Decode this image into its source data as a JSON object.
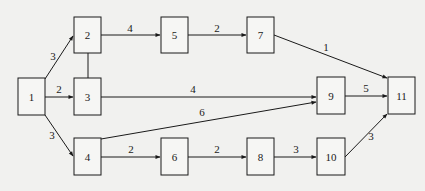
{
  "nodes": [
    {
      "id": "1",
      "label": "1",
      "x": 18,
      "y": 78,
      "w": 27,
      "h": 37
    },
    {
      "id": "2",
      "label": "2",
      "x": 74,
      "y": 17,
      "w": 27,
      "h": 36
    },
    {
      "id": "3",
      "label": "3",
      "x": 74,
      "y": 78,
      "w": 27,
      "h": 37
    },
    {
      "id": "4",
      "label": "4",
      "x": 74,
      "y": 138,
      "w": 27,
      "h": 37
    },
    {
      "id": "5",
      "label": "5",
      "x": 161,
      "y": 17,
      "w": 27,
      "h": 36
    },
    {
      "id": "6",
      "label": "6",
      "x": 161,
      "y": 138,
      "w": 27,
      "h": 37
    },
    {
      "id": "7",
      "label": "7",
      "x": 247,
      "y": 17,
      "w": 27,
      "h": 36
    },
    {
      "id": "8",
      "label": "8",
      "x": 247,
      "y": 138,
      "w": 27,
      "h": 37
    },
    {
      "id": "9",
      "label": "9",
      "x": 317,
      "y": 77,
      "w": 28,
      "h": 37
    },
    {
      "id": "10",
      "label": "10",
      "x": 317,
      "y": 138,
      "w": 28,
      "h": 37
    },
    {
      "id": "11",
      "label": "11",
      "x": 388,
      "y": 77,
      "w": 27,
      "h": 37
    }
  ],
  "edges": [
    {
      "from": "1",
      "to": "2",
      "weight": "3",
      "x1": 45,
      "y1": 79,
      "x2": 73,
      "y2": 36,
      "lx": 53,
      "ly": 60
    },
    {
      "from": "1",
      "to": "3",
      "weight": "2",
      "x1": 45,
      "y1": 97,
      "x2": 73,
      "y2": 97,
      "lx": 59,
      "ly": 93
    },
    {
      "from": "1",
      "to": "4",
      "weight": "3",
      "x1": 45,
      "y1": 115,
      "x2": 73,
      "y2": 156,
      "lx": 52,
      "ly": 139
    },
    {
      "from": "2",
      "to": "5",
      "weight": "4",
      "x1": 101,
      "y1": 35,
      "x2": 160,
      "y2": 35,
      "lx": 130,
      "ly": 32
    },
    {
      "from": "5",
      "to": "7",
      "weight": "2",
      "x1": 188,
      "y1": 35,
      "x2": 246,
      "y2": 35,
      "lx": 217,
      "ly": 32
    },
    {
      "from": "7",
      "to": "11",
      "weight": "1",
      "x1": 274,
      "y1": 35,
      "x2": 387,
      "y2": 78,
      "lx": 326,
      "ly": 51
    },
    {
      "from": "3",
      "to": "9",
      "weight": "4",
      "x1": 101,
      "y1": 97,
      "x2": 316,
      "y2": 97,
      "lx": 193,
      "ly": 93
    },
    {
      "from": "4",
      "to": "9",
      "weight": "6",
      "x1": 101,
      "y1": 139,
      "x2": 316,
      "y2": 102,
      "lx": 202,
      "ly": 116
    },
    {
      "from": "9",
      "to": "11",
      "weight": "5",
      "x1": 345,
      "y1": 96,
      "x2": 387,
      "y2": 96,
      "lx": 366,
      "ly": 92
    },
    {
      "from": "4",
      "to": "6",
      "weight": "2",
      "x1": 101,
      "y1": 157,
      "x2": 160,
      "y2": 157,
      "lx": 131,
      "ly": 153
    },
    {
      "from": "6",
      "to": "8",
      "weight": "2",
      "x1": 188,
      "y1": 157,
      "x2": 246,
      "y2": 157,
      "lx": 217,
      "ly": 153
    },
    {
      "from": "8",
      "to": "10",
      "weight": "3",
      "x1": 274,
      "y1": 157,
      "x2": 316,
      "y2": 157,
      "lx": 296,
      "ly": 153
    },
    {
      "from": "10",
      "to": "11",
      "weight": "3",
      "x1": 345,
      "y1": 157,
      "x2": 387,
      "y2": 114,
      "lx": 371,
      "ly": 140
    }
  ],
  "connectors": [
    {
      "from": "2",
      "to": "3",
      "x1": 88,
      "y1": 53,
      "x2": 88,
      "y2": 78
    }
  ],
  "colors": {
    "stroke": "#1a1a1a",
    "background": "#f1f1ef",
    "node_fill": "#f6f6f4"
  }
}
